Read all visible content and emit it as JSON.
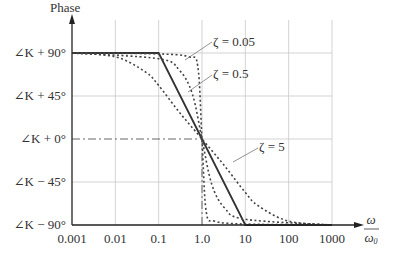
{
  "chart_data": {
    "type": "line",
    "title": "",
    "ylabel": "Phase",
    "xlabel_num": "ω",
    "xlabel_den": "ω0",
    "x_scale": "log",
    "x_ticks": [
      "0.001",
      "0.01",
      "0.1",
      "1.0",
      "10",
      "100",
      "1000"
    ],
    "y_ticks": [
      "∠K + 90°",
      "∠K + 45°",
      "∠K + 0°",
      "∠K − 45°",
      "∠K − 90°"
    ],
    "y_values": [
      90,
      45,
      0,
      -45,
      -90
    ],
    "xlim": [
      0.001,
      1000
    ],
    "ylim": [
      -90,
      90
    ],
    "grid": true,
    "series": [
      {
        "name": "Asymptotic approximation",
        "style": "solid",
        "x": [
          0.001,
          0.1,
          10,
          1000
        ],
        "y": [
          90,
          90,
          -90,
          -90
        ]
      },
      {
        "name": "ζ = 0.05",
        "style": "dotted",
        "x": [
          0.001,
          0.1,
          0.5,
          0.8,
          1.0,
          1.25,
          2,
          10,
          1000
        ],
        "y": [
          90,
          89,
          86,
          76,
          0,
          -76,
          -86,
          -89,
          -90
        ]
      },
      {
        "name": "ζ = 0.5",
        "style": "dotted",
        "x": [
          0.001,
          0.1,
          0.3,
          0.6,
          1.0,
          1.67,
          3.3,
          10,
          1000
        ],
        "y": [
          90,
          84,
          72,
          47,
          0,
          -47,
          -72,
          -84,
          -90
        ]
      },
      {
        "name": "ζ = 5",
        "style": "dotted",
        "x": [
          0.001,
          0.01,
          0.05,
          0.1,
          0.3,
          1.0,
          3.3,
          10,
          20,
          100,
          1000
        ],
        "y": [
          90,
          86,
          70,
          56,
          28,
          0,
          -28,
          -56,
          -70,
          -86,
          -90
        ]
      }
    ],
    "annotations": [
      {
        "text": "ζ = 0.05",
        "points_to": "ζ = 0.05 curve"
      },
      {
        "text": "ζ = 0.5",
        "points_to": "ζ = 0.5 curve"
      },
      {
        "text": "ζ = 5",
        "points_to": "ζ = 5 curve"
      }
    ],
    "reference_lines": [
      {
        "type": "horizontal",
        "y": 0,
        "style": "dash-dot",
        "x_range": [
          0.001,
          1.0
        ]
      },
      {
        "type": "vertical",
        "x": 1.0,
        "style": "dash-dot",
        "y_range": [
          -90,
          0
        ]
      }
    ]
  },
  "labels": {
    "phase": "Phase",
    "omega": "ω",
    "omega0": "ω0",
    "zeta005": "ζ = 0.05",
    "zeta05": "ζ = 0.5",
    "zeta5": "ζ = 5"
  }
}
